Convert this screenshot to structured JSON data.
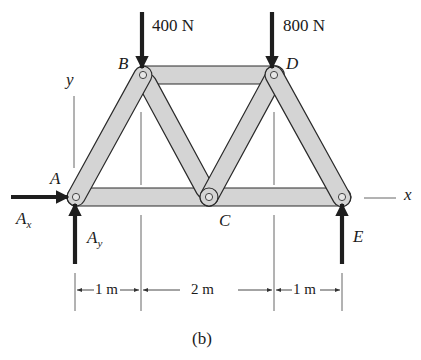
{
  "figure": {
    "caption": "(b)",
    "colors": {
      "member_fill": "#d4d4d4",
      "member_stroke": "#2a2a2a",
      "force_arrow": "#1e1e1e",
      "line": "#555555"
    }
  },
  "loads": [
    {
      "id": "load_B",
      "label": "400 N",
      "joint": "B",
      "direction": "down"
    },
    {
      "id": "load_D",
      "label": "800 N",
      "joint": "D",
      "direction": "down"
    }
  ],
  "joints": {
    "A": "A",
    "B": "B",
    "C": "C",
    "D": "D",
    "E": "E"
  },
  "reactions": {
    "Ax": {
      "main": "A",
      "sub": "x",
      "direction": "right"
    },
    "Ay": {
      "main": "A",
      "sub": "y",
      "direction": "up"
    },
    "E": {
      "direction": "up"
    }
  },
  "axes": {
    "x": "x",
    "y": "y"
  },
  "members": [
    "AB",
    "BC",
    "BD",
    "CD",
    "DE",
    "AC",
    "CE"
  ],
  "dimensions": [
    {
      "label": "1 m",
      "from": "A",
      "to": "B"
    },
    {
      "label": "2 m",
      "from": "B",
      "to": "D"
    },
    {
      "label": "1 m",
      "from": "D",
      "to": "E"
    }
  ]
}
